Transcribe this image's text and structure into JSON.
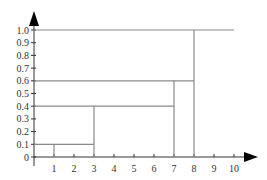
{
  "chart_data": {
    "type": "line",
    "subtype": "step",
    "title": "",
    "xlabel": "",
    "ylabel": "",
    "xlim": [
      0,
      10
    ],
    "ylim": [
      0,
      1.0
    ],
    "x_ticks": [
      "1",
      "2",
      "3",
      "4",
      "5",
      "6",
      "7",
      "8",
      "9",
      "10"
    ],
    "y_ticks": [
      "0",
      "0.1",
      "0.2",
      "0.3",
      "0.4",
      "0.5",
      "0.6",
      "0.7",
      "0.8",
      "0.9",
      "1.0"
    ],
    "grid": false,
    "legend": null,
    "series": [
      {
        "name": "step function",
        "points": [
          {
            "x_start": 1,
            "x_end": 3,
            "y": 0.1
          },
          {
            "x_start": 3,
            "x_end": 7,
            "y": 0.4
          },
          {
            "x_start": 7,
            "x_end": 8,
            "y": 0.6
          },
          {
            "x_start": 8,
            "x_end": 10,
            "y": 1.0
          }
        ]
      }
    ],
    "level_guides": [
      0.1,
      0.4,
      0.6,
      1.0
    ],
    "step_positions": [
      1,
      3,
      7,
      8
    ]
  }
}
